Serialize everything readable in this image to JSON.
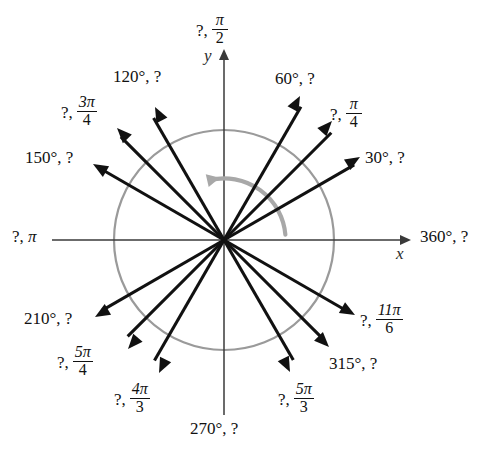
{
  "figure": {
    "center": {
      "x": 224,
      "y": 240
    },
    "radius": 110,
    "colors": {
      "ray": "#111111",
      "circle": "#9a9a9a",
      "axis": "#3a3a3a",
      "direction_arc": "#a8a8a8",
      "background": "#ffffff"
    },
    "axes": {
      "x_letter": "x",
      "y_letter": "y"
    },
    "direction_arc": {
      "name": "counterclockwise-direction-arc",
      "from_angle": 5,
      "to_angle": 103
    }
  },
  "chart_data": {
    "type": "scatter",
    "xlabel": "x",
    "ylabel": "y",
    "grid": false,
    "legend": null,
    "xlim": [
      -1.25,
      1.25
    ],
    "ylim": [
      -1.25,
      1.25
    ],
    "note": "Each ray is labeled with a degree/radian pair; one member of each pair is hidden as a question mark.",
    "rays": [
      {
        "angle_deg": 30,
        "label_kind": "degrees",
        "degrees_text": "30°",
        "radians_text": "?",
        "radian_value": "pi/6",
        "label_full": "30°, ?",
        "tip": {
          "x": 360,
          "y": 157
        },
        "label_pos": {
          "x": 365,
          "y": 149
        },
        "frac": null
      },
      {
        "angle_deg": 45,
        "label_kind": "radians",
        "degrees_text": "?",
        "radians_text": "π/4",
        "radian_value": "pi/4",
        "label_full": "?, π/4",
        "tip": {
          "x": 332,
          "y": 121
        },
        "label_pos": {
          "x": 330,
          "y": 97
        },
        "frac": {
          "num": "π",
          "den": "4"
        }
      },
      {
        "angle_deg": 60,
        "label_kind": "degrees",
        "degrees_text": "60°",
        "radians_text": "?",
        "radian_value": "pi/3",
        "label_full": "60°, ?",
        "tip": {
          "x": 300,
          "y": 96
        },
        "label_pos": {
          "x": 275,
          "y": 70
        },
        "frac": null
      },
      {
        "angle_deg": 90,
        "label_kind": "radians",
        "degrees_text": "?",
        "radians_text": "π/2",
        "radian_value": "pi/2",
        "label_full": "?, π/2",
        "tip": {
          "x": 224,
          "y": 50
        },
        "label_pos": {
          "x": 196,
          "y": 13
        },
        "frac": {
          "num": "π",
          "den": "2"
        }
      },
      {
        "angle_deg": 120,
        "label_kind": "degrees",
        "degrees_text": "120°",
        "radians_text": "?",
        "radian_value": "2pi/3",
        "label_full": "120°, ?",
        "tip": {
          "x": 155,
          "y": 107
        },
        "label_pos": {
          "x": 113,
          "y": 68
        },
        "frac": null
      },
      {
        "angle_deg": 135,
        "label_kind": "radians",
        "degrees_text": "?",
        "radians_text": "3π/4",
        "radian_value": "3pi/4",
        "label_full": "?, 3π/4",
        "tip": {
          "x": 117,
          "y": 128
        },
        "label_pos": {
          "x": 61,
          "y": 95
        },
        "frac": {
          "num": "3π",
          "den": "4"
        }
      },
      {
        "angle_deg": 150,
        "label_kind": "degrees",
        "degrees_text": "150°",
        "radians_text": "?",
        "radian_value": "5pi/6",
        "label_full": "150°, ?",
        "tip": {
          "x": 93,
          "y": 164
        },
        "label_pos": {
          "x": 25,
          "y": 149
        },
        "frac": null
      },
      {
        "angle_deg": 180,
        "label_kind": "radians",
        "degrees_text": "?",
        "radians_text": "π",
        "radian_value": "pi",
        "label_full": "?, π",
        "tip": {
          "x": 52,
          "y": 240
        },
        "label_pos": {
          "x": 12,
          "y": 228
        },
        "frac": null
      },
      {
        "angle_deg": 210,
        "label_kind": "degrees",
        "degrees_text": "210°",
        "radians_text": "?",
        "radian_value": "7pi/6",
        "label_full": "210°, ?",
        "tip": {
          "x": 95,
          "y": 317
        },
        "label_pos": {
          "x": 24,
          "y": 310
        },
        "frac": null
      },
      {
        "angle_deg": 225,
        "label_kind": "radians",
        "degrees_text": "?",
        "radians_text": "5π/4",
        "radian_value": "5pi/4",
        "label_full": "?, 5π/4",
        "tip": {
          "x": 128,
          "y": 349
        },
        "label_pos": {
          "x": 57,
          "y": 345
        },
        "frac": {
          "num": "5π",
          "den": "4"
        }
      },
      {
        "angle_deg": 240,
        "label_kind": "radians",
        "degrees_text": "?",
        "radians_text": "4π/3",
        "radian_value": "4pi/3",
        "label_full": "?, 4π/3",
        "tip": {
          "x": 159,
          "y": 373
        },
        "label_pos": {
          "x": 114,
          "y": 382
        },
        "frac": {
          "num": "4π",
          "den": "3"
        }
      },
      {
        "angle_deg": 270,
        "label_kind": "degrees",
        "degrees_text": "270°",
        "radians_text": "?",
        "radian_value": "3pi/2",
        "label_full": "270°, ?",
        "tip": {
          "x": 224,
          "y": 415
        },
        "label_pos": {
          "x": 190,
          "y": 420
        },
        "frac": null
      },
      {
        "angle_deg": 300,
        "label_kind": "radians",
        "degrees_text": "?",
        "radians_text": "5π/3",
        "radian_value": "5pi/3",
        "label_full": "?, 5π/3",
        "tip": {
          "x": 290,
          "y": 372
        },
        "label_pos": {
          "x": 278,
          "y": 382
        },
        "frac": {
          "num": "5π",
          "den": "3"
        }
      },
      {
        "angle_deg": 315,
        "label_kind": "degrees",
        "degrees_text": "315°",
        "radians_text": "?",
        "radian_value": "7pi/4",
        "label_full": "315°, ?",
        "tip": {
          "x": 329,
          "y": 347
        },
        "label_pos": {
          "x": 329,
          "y": 355
        },
        "frac": null
      },
      {
        "angle_deg": 330,
        "label_kind": "radians",
        "degrees_text": "?",
        "radians_text": "11π/6",
        "radian_value": "11pi/6",
        "label_full": "?, 11π/6",
        "tip": {
          "x": 355,
          "y": 315
        },
        "label_pos": {
          "x": 360,
          "y": 303
        },
        "frac": {
          "num": "11π",
          "den": "6"
        }
      },
      {
        "angle_deg": 360,
        "label_kind": "degrees",
        "degrees_text": "360°",
        "radians_text": "?",
        "radian_value": "2pi",
        "label_full": "360°, ?",
        "tip": {
          "x": 410,
          "y": 240
        },
        "label_pos": {
          "x": 420,
          "y": 228
        },
        "frac": null
      }
    ]
  }
}
